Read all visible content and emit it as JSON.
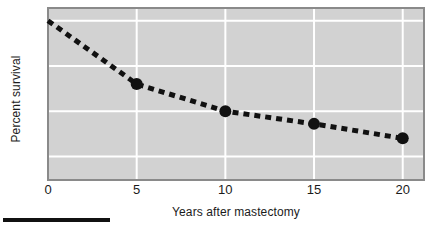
{
  "chart_data": {
    "type": "line",
    "title": "",
    "subtitle": "",
    "xlabel": "Years after mastectomy",
    "ylabel": "Percent survival",
    "x": [
      0,
      5,
      10,
      15,
      20
    ],
    "values": [
      100,
      65,
      50,
      43,
      35
    ],
    "series": [
      {
        "name": "Percent survival",
        "x": [
          0,
          5,
          10,
          15,
          20
        ],
        "values": [
          100,
          65,
          50,
          43,
          35
        ],
        "line_style": "dashed",
        "line_color": "#111111",
        "marker": "circle",
        "marker_color": "#111111"
      }
    ],
    "xlim": [
      0,
      21.2
    ],
    "ylim": [
      12,
      107
    ],
    "xticks": [
      0,
      5,
      10,
      15,
      20
    ],
    "xtick_labels": [
      "0",
      "5",
      "10",
      "15",
      "20"
    ],
    "yticks": [
      25,
      50,
      75,
      100
    ],
    "ytick_labels": [
      "25",
      "50",
      "75",
      "100"
    ],
    "grid": true,
    "grid_color": "#ffffff",
    "plot_background": "#d2d2d2",
    "legend": "none",
    "annotations": []
  },
  "figure": {
    "axis_title_y": "Percent survival",
    "axis_title_x": "Years after mastectomy",
    "ytick_labels": [
      "100",
      "75",
      "50",
      "25"
    ],
    "xtick_labels": [
      "0",
      "5",
      "10",
      "15",
      "20"
    ]
  }
}
